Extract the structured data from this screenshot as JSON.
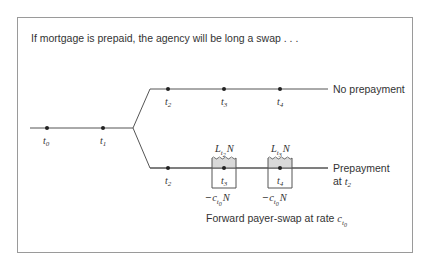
{
  "title": "If mortgage is prepaid, the agency will be long a swap . . .",
  "timeline": {
    "main_nodes": [
      {
        "var": "t",
        "sub": "0"
      },
      {
        "var": "t",
        "sub": "1"
      }
    ],
    "upper_branch": {
      "label": "No prepayment",
      "nodes": [
        {
          "var": "t",
          "sub": "2"
        },
        {
          "var": "t",
          "sub": "3"
        },
        {
          "var": "t",
          "sub": "4"
        }
      ]
    },
    "lower_branch": {
      "label_line1": "Prepayment",
      "label_line2_prefix": "at ",
      "label_line2_var": "t",
      "label_line2_sub": "2",
      "nodes": [
        {
          "var": "t",
          "sub": "2"
        },
        {
          "var": "t",
          "sub": "3"
        },
        {
          "var": "t",
          "sub": "4"
        }
      ]
    }
  },
  "swap_boxes": [
    {
      "receive": {
        "var": "L",
        "sub": "t",
        "subsub": "2",
        "suffix": "N"
      },
      "pay": {
        "prefix": "−",
        "var": "c",
        "sub": "t",
        "subsub": "0",
        "suffix": "N"
      }
    },
    {
      "receive": {
        "var": "L",
        "sub": "t",
        "subsub": "3",
        "suffix": "N"
      },
      "pay": {
        "prefix": "−",
        "var": "c",
        "sub": "t",
        "subsub": "0",
        "suffix": "N"
      }
    }
  ],
  "caption": {
    "text": "Forward payer-swap at rate ",
    "var": "c",
    "sub": "t",
    "subsub": "0"
  },
  "colors": {
    "frame": "#9a9a9a",
    "line": "#555555",
    "dot": "#222222",
    "box_fill": "#d9d9d9",
    "text": "#333333"
  }
}
